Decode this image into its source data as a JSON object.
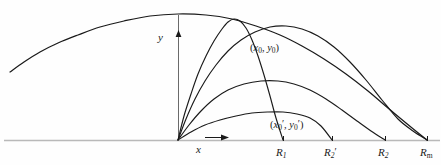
{
  "figure": {
    "kind": "projectile-trajectory-envelope-diagram",
    "background_color": "#fefefe",
    "ink_color": "#1a1a1a",
    "baseline_color": "#b9b9b9",
    "axis_color": "#555555"
  },
  "axes": {
    "x_label": "x",
    "y_label": "y",
    "x_axis_arrow": "arrow-right",
    "y_axis_arrow": "arrow-up",
    "origin_px": {
      "x": 178,
      "y": 140
    },
    "baseline_y_px": 140,
    "baseline_x_start_px": 4,
    "baseline_x_end_px": 440,
    "y_axis_top_px": 14
  },
  "point_labels": [
    {
      "name": "upper-intersection-point",
      "open_paren": "(",
      "x_var": "x",
      "x_sub": "0",
      "x_prime": "",
      "comma": ", ",
      "y_var": "y",
      "y_sub": "0",
      "y_prime": "",
      "close_paren": ")",
      "plain": "(x0, y0)",
      "left_px": 250,
      "top_px": 43
    },
    {
      "name": "lower-intersection-point",
      "open_paren": "(",
      "x_var": "x",
      "x_sub": "0",
      "x_prime": "′",
      "comma": ", ",
      "y_var": "y",
      "y_sub": "0",
      "y_prime": "′",
      "close_paren": ")",
      "plain": "(x0', y0')",
      "left_px": 270,
      "top_px": 119
    }
  ],
  "range_labels": [
    {
      "name": "range-R1",
      "symbol": "R",
      "sub": "1",
      "prime": "",
      "plain": "R1",
      "tick_x_px": 283,
      "left_px": 276,
      "top_px": 147
    },
    {
      "name": "range-R2-prime",
      "symbol": "R",
      "sub": "2",
      "prime": "′",
      "plain": "R2'",
      "tick_x_px": 332,
      "left_px": 324,
      "top_px": 147
    },
    {
      "name": "range-R2",
      "symbol": "R",
      "sub": "2",
      "prime": "",
      "plain": "R2",
      "tick_x_px": 385,
      "left_px": 378,
      "top_px": 147
    },
    {
      "name": "range-Rm",
      "symbol": "R",
      "sub": "m",
      "prime": "",
      "plain": "Rm",
      "tick_x_px": 427,
      "left_px": 420,
      "top_px": 147
    }
  ],
  "chart_data": {
    "type": "line",
    "title": "",
    "xlabel": "x",
    "ylabel": "y",
    "grid": false,
    "legend": "none",
    "origin": {
      "x": 178,
      "y": 140
    },
    "series": [
      {
        "name": "envelope-parabola",
        "role": "envelope",
        "landing_label": "Rm",
        "points_px": [
          [
            10,
            72
          ],
          [
            24,
            62
          ],
          [
            40,
            52
          ],
          [
            58,
            43
          ],
          [
            78,
            35
          ],
          [
            100,
            27
          ],
          [
            124,
            21
          ],
          [
            150,
            16
          ],
          [
            178,
            14
          ],
          [
            206,
            15
          ],
          [
            232,
            19
          ],
          [
            256,
            26
          ],
          [
            280,
            35
          ],
          [
            302,
            46
          ],
          [
            324,
            59
          ],
          [
            346,
            74
          ],
          [
            368,
            91
          ],
          [
            388,
            108
          ],
          [
            406,
            123
          ],
          [
            427,
            140
          ]
        ]
      },
      {
        "name": "trajectory-steep",
        "role": "trajectory",
        "landing_label": "R1",
        "points_px": [
          [
            178,
            140
          ],
          [
            184,
            116
          ],
          [
            191,
            94
          ],
          [
            198,
            74
          ],
          [
            206,
            56
          ],
          [
            214,
            41
          ],
          [
            222,
            29
          ],
          [
            228,
            22
          ],
          [
            234,
            19
          ],
          [
            240,
            21
          ],
          [
            246,
            28
          ],
          [
            252,
            40
          ],
          [
            258,
            56
          ],
          [
            264,
            75
          ],
          [
            270,
            96
          ],
          [
            276,
            118
          ],
          [
            283,
            140
          ]
        ]
      },
      {
        "name": "trajectory-high-long",
        "role": "trajectory",
        "landing_label": "Rm",
        "points_px": [
          [
            178,
            140
          ],
          [
            186,
            119
          ],
          [
            195,
            99
          ],
          [
            205,
            81
          ],
          [
            216,
            65
          ],
          [
            228,
            51
          ],
          [
            241,
            40
          ],
          [
            255,
            32
          ],
          [
            270,
            27
          ],
          [
            286,
            26
          ],
          [
            302,
            29
          ],
          [
            318,
            36
          ],
          [
            334,
            47
          ],
          [
            350,
            62
          ],
          [
            366,
            80
          ],
          [
            382,
            100
          ],
          [
            398,
            119
          ],
          [
            413,
            131
          ],
          [
            427,
            140
          ]
        ]
      },
      {
        "name": "trajectory-mid",
        "role": "trajectory",
        "landing_label": "R2",
        "points_px": [
          [
            178,
            140
          ],
          [
            189,
            125
          ],
          [
            201,
            111
          ],
          [
            214,
            99
          ],
          [
            228,
            90
          ],
          [
            244,
            84
          ],
          [
            261,
            81
          ],
          [
            278,
            81
          ],
          [
            294,
            84
          ],
          [
            310,
            90
          ],
          [
            326,
            99
          ],
          [
            342,
            110
          ],
          [
            357,
            121
          ],
          [
            371,
            131
          ],
          [
            385,
            140
          ]
        ]
      },
      {
        "name": "trajectory-flat",
        "role": "trajectory",
        "landing_label": "R2'",
        "points_px": [
          [
            178,
            140
          ],
          [
            191,
            132
          ],
          [
            205,
            125
          ],
          [
            220,
            120
          ],
          [
            236,
            116
          ],
          [
            252,
            113
          ],
          [
            268,
            112
          ],
          [
            283,
            112
          ],
          [
            297,
            114
          ],
          [
            310,
            118
          ],
          [
            321,
            126
          ],
          [
            332,
            140
          ]
        ]
      }
    ]
  }
}
